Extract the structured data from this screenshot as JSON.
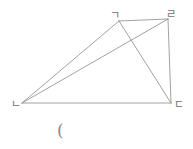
{
  "figure": {
    "type": "geometry-diagram",
    "shape": "quadrilateral-with-both-diagonals",
    "background_color": "#ffffff",
    "stroke_color": "#8a8a8a",
    "label_color": "#6f6f6f",
    "stroke_width": 0.8,
    "vertices": [
      {
        "id": "g",
        "label": "ㄱ",
        "x": 119,
        "y": 21,
        "label_x": 110,
        "label_y": 10
      },
      {
        "id": "r",
        "label": "ㄹ",
        "x": 168,
        "y": 19,
        "label_x": 166,
        "label_y": 9
      },
      {
        "id": "d",
        "label": "ㄷ",
        "x": 171,
        "y": 103,
        "label_x": 174,
        "label_y": 99
      },
      {
        "id": "n",
        "label": "ㄴ",
        "x": 22,
        "y": 103,
        "label_x": 11,
        "label_y": 99
      }
    ],
    "edges": [
      {
        "name": "edge-g-r",
        "from": "g",
        "to": "r"
      },
      {
        "name": "edge-r-d",
        "from": "r",
        "to": "d"
      },
      {
        "name": "edge-d-n",
        "from": "d",
        "to": "n"
      },
      {
        "name": "edge-n-g",
        "from": "n",
        "to": "g"
      }
    ],
    "diagonals": [
      {
        "name": "diagonal-n-r",
        "from": "n",
        "to": "r"
      },
      {
        "name": "diagonal-g-d",
        "from": "g",
        "to": "d"
      }
    ],
    "caption": "("
  }
}
